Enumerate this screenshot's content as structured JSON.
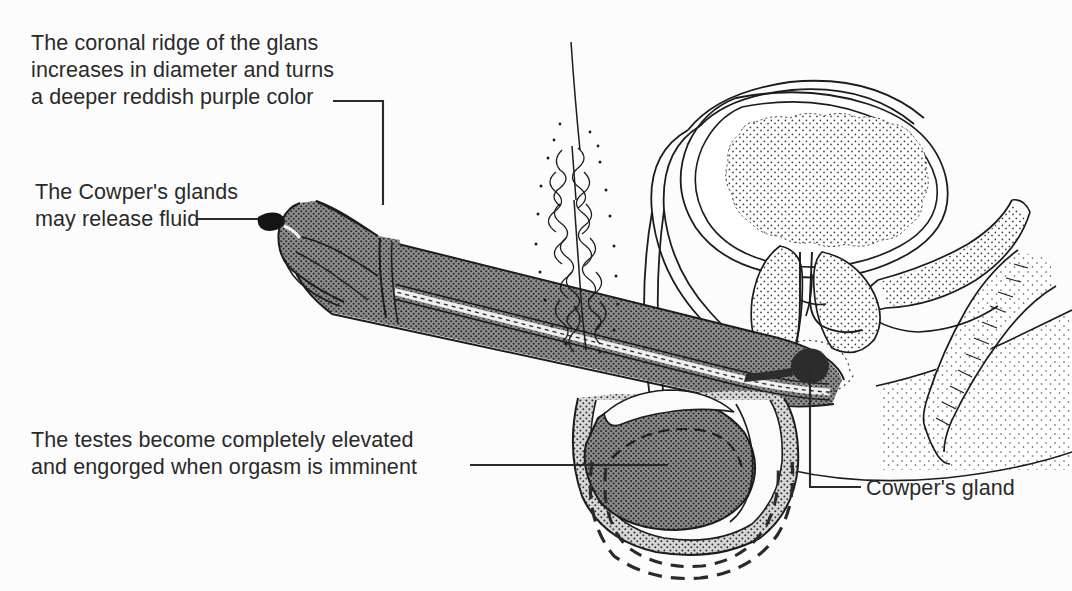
{
  "figure": {
    "background_color": "#fcfcfc",
    "ink_color": "#1c1c1c",
    "tissue_gray": "#8e8e8e",
    "text_color": "#2a2a2a"
  },
  "labels": {
    "coronal_ridge": "The coronal ridge of the glans\nincreases in diameter and turns\na deeper reddish purple color",
    "cowper_glands_release": "The Cowper's glands\nmay release fluid",
    "testes_elevated": "The testes become completely elevated\nand engorged when orgasm is imminent",
    "cowper_gland": "Cowper's gland"
  },
  "structures": [
    {
      "name": "glans-penis",
      "fill": "stipple-gray"
    },
    {
      "name": "coronal-ridge",
      "fill": "stipple-gray"
    },
    {
      "name": "penile-shaft",
      "fill": "stipple-gray"
    },
    {
      "name": "urethra",
      "fill": "light-band"
    },
    {
      "name": "urinary-bladder",
      "fill": "light-stipple"
    },
    {
      "name": "prostate-gland",
      "fill": "light-stipple"
    },
    {
      "name": "seminal-vesicle",
      "fill": "light-stipple"
    },
    {
      "name": "vas-deferens",
      "fill": "outline"
    },
    {
      "name": "cowper-gland",
      "fill": "solid-dark"
    },
    {
      "name": "testis",
      "fill": "stipple-gray"
    },
    {
      "name": "epididymis",
      "fill": "stipple-gray"
    },
    {
      "name": "scrotum",
      "fill": "stipple-gray"
    },
    {
      "name": "scrotum-unelevated-outline",
      "fill": "dashed"
    },
    {
      "name": "rectum",
      "fill": "stipple-light"
    },
    {
      "name": "pubic-hair",
      "fill": "line-art"
    },
    {
      "name": "buttock",
      "fill": "outline"
    }
  ]
}
